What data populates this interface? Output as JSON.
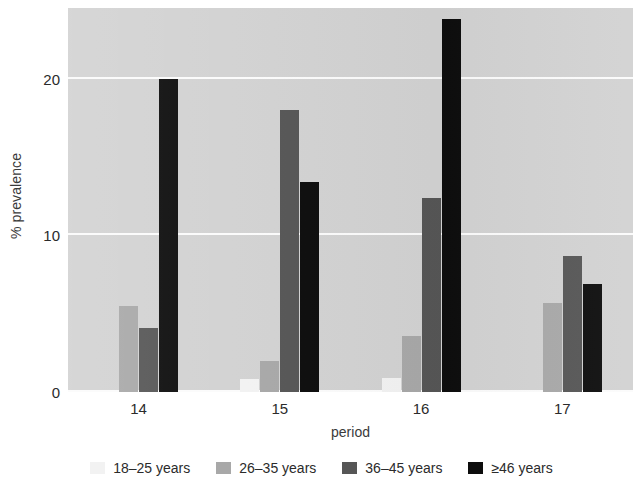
{
  "chart_data": {
    "type": "bar",
    "title": "",
    "xlabel": "period",
    "ylabel": "% prevalence",
    "categories": [
      "14",
      "15",
      "16",
      "17"
    ],
    "yticks": [
      0,
      10,
      20
    ],
    "ytick_labels": [
      "0",
      "10",
      "20"
    ],
    "ylim": [
      0,
      24.5
    ],
    "grid": true,
    "legend_position": "bottom",
    "plot_background": "#d2d2d2",
    "gridline_color": "#fbfbfb",
    "series": [
      {
        "name": "18–25 years",
        "color": "#f2f2f2",
        "values": [
          0,
          0.8,
          0.9,
          0
        ]
      },
      {
        "name": "26–35 years",
        "color": "#a8a8a8",
        "values": [
          5.5,
          2.0,
          3.6,
          5.7
        ]
      },
      {
        "name": "36–45 years",
        "color": "#565656",
        "values": [
          4.1,
          18.0,
          12.4,
          8.7
        ]
      },
      {
        "name": "≥46 years",
        "color": "#0d0d0d",
        "values": [
          20.0,
          13.4,
          23.8,
          6.9
        ]
      }
    ]
  }
}
